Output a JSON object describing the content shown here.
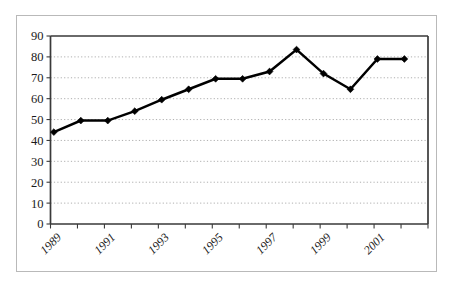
{
  "chart_data": {
    "type": "line",
    "title": "",
    "subtitle": "",
    "xlabel": "",
    "ylabel": "",
    "grid": true,
    "legend": "none",
    "xlim": [
      1989,
      2002
    ],
    "ylim": [
      0,
      90
    ],
    "yticks": [
      0,
      10,
      20,
      30,
      40,
      50,
      60,
      70,
      80,
      90
    ],
    "ytick_labels": [
      "0",
      "10",
      "20",
      "30",
      "40",
      "50",
      "60",
      "70",
      "80",
      "90"
    ],
    "xtick_labels": [
      "1989",
      "",
      "1991",
      "",
      "1993",
      "",
      "1995",
      "",
      "1997",
      "",
      "1999",
      "",
      "2001",
      ""
    ],
    "xtick_labels_shown": [
      "1989",
      "1991",
      "1993",
      "1995",
      "1997",
      "1999",
      "2001"
    ],
    "x": [
      1989,
      1990,
      1991,
      1992,
      1993,
      1994,
      1995,
      1996,
      1997,
      1998,
      1999,
      2000,
      2001,
      2002
    ],
    "values": [
      44,
      49.5,
      49.5,
      54,
      59.5,
      64.5,
      69.5,
      69.5,
      73,
      83.5,
      72,
      64.5,
      79,
      79
    ],
    "series": [
      {
        "name": "series-1",
        "color": "#000000",
        "marker": "diamond",
        "values": [
          44,
          49.5,
          49.5,
          54,
          59.5,
          64.5,
          69.5,
          69.5,
          73,
          83.5,
          72,
          64.5,
          79,
          79
        ]
      }
    ]
  },
  "colors": {
    "line": "#000000",
    "marker": "#000000",
    "grid": "#9a9a9a",
    "axis": "#3a3a3a",
    "outer_border": "#b9b9b9",
    "background": "#ffffff",
    "text": "#1a1a1a"
  }
}
